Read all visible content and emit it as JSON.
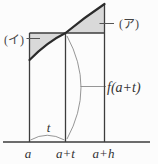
{
  "diagram": {
    "labels": {
      "region_left": "(イ)",
      "region_right": "(ア)",
      "height_value": "f(a+t)",
      "t_value": "t",
      "axis_a": "a",
      "axis_a_plus_t": "a+t",
      "axis_a_plus_h": "a+h"
    },
    "colors": {
      "shade_fill": "#d9d9d9",
      "shade_edge": "#9a9a9a",
      "main_line": "#3d3d3d",
      "curve_line": "#2b2b2b",
      "thin_line": "#8a8a8a",
      "dash_line": "#555555",
      "text": "#333333",
      "background": "#fcfcfc"
    }
  }
}
